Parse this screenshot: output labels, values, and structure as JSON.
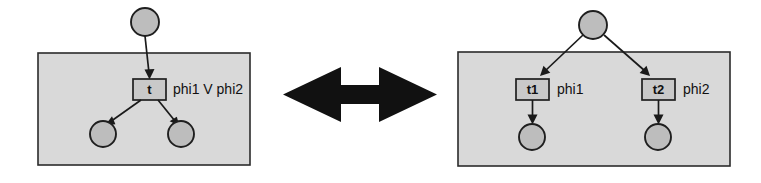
{
  "figure": {
    "relation_symbol": "double-headed-arrow",
    "left_net": {
      "name": "disjunctive-transition-net",
      "top_place": {
        "label": ""
      },
      "transition": {
        "label": "t"
      },
      "formula": "phi1 V phi2",
      "output_places": [
        {
          "label": ""
        },
        {
          "label": ""
        }
      ]
    },
    "right_net": {
      "name": "split-transition-net",
      "top_place": {
        "label": ""
      },
      "transitions": [
        {
          "label": "t1",
          "formula": "phi1"
        },
        {
          "label": "t2",
          "formula": "phi2"
        }
      ],
      "output_places": [
        {
          "label": ""
        },
        {
          "label": ""
        }
      ]
    },
    "colors": {
      "panel_fill": "#d9d9d9",
      "panel_stroke": "#2b2b2b",
      "place_fill": "#bdbdbd",
      "place_stroke": "#1f1f1f",
      "transition_fill": "#c9c9c9",
      "transition_stroke": "#1f1f1f",
      "arc_color": "#1a1a1a",
      "arrow_color": "#111111",
      "background": "#ffffff"
    }
  }
}
